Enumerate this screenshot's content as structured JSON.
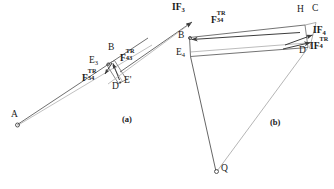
{
  "figure": {
    "background_color": "#ffffff",
    "line_color": "#4a4a4a",
    "line_color_light": "#9a9a9a",
    "text_color": "#1a1a1a",
    "width": 334,
    "height": 189
  },
  "panels": [
    {
      "id": "panel-a",
      "label": "(a)",
      "x": 124,
      "y": 119
    },
    {
      "id": "panel-b",
      "label": "(b)",
      "x": 272,
      "y": 122
    }
  ],
  "panel_a": {
    "points": [
      {
        "name": "A",
        "label": "A",
        "x": 17,
        "y": 125,
        "marker": "circle",
        "label_x": 11,
        "label_y": 112
      },
      {
        "name": "E3",
        "base": "E",
        "subscript": "3",
        "x": 105,
        "y": 65,
        "marker": "dot",
        "label_x": 91,
        "label_y": 59
      },
      {
        "name": "B",
        "label": "B",
        "x": 112,
        "y": 62,
        "marker": "none",
        "label_x": 110,
        "label_y": 48
      },
      {
        "name": "D",
        "label": "D",
        "x": 118,
        "y": 83,
        "marker": "dot",
        "label_x": 113,
        "label_y": 84
      },
      {
        "name": "Ep",
        "label": "E'",
        "x": 126,
        "y": 81,
        "marker": "none",
        "label_x": 124,
        "label_y": 77
      }
    ],
    "force_labels": [
      {
        "name": "F43",
        "base": "F",
        "sup": "TR",
        "sub": "43",
        "x": 120,
        "y": 56
      },
      {
        "name": "F34",
        "base": "F",
        "sup": "TR",
        "sub": "34",
        "x": 84,
        "y": 75
      }
    ]
  },
  "panel_b": {
    "points": [
      {
        "name": "B",
        "label": "B",
        "x": 188,
        "y": 38,
        "marker": "dot",
        "label_x": 180,
        "label_y": 32
      },
      {
        "name": "E4",
        "base": "E",
        "subscript": "4",
        "x": 190,
        "y": 56,
        "marker": "none",
        "label_x": 178,
        "label_y": 50
      },
      {
        "name": "H",
        "label": "H",
        "x": 304,
        "y": 25,
        "marker": "none",
        "label_x": 300,
        "label_y": 8
      },
      {
        "name": "C",
        "label": "C",
        "x": 315,
        "y": 22,
        "marker": "none",
        "label_x": 313,
        "label_y": 7
      },
      {
        "name": "D",
        "label": "D",
        "x": 307,
        "y": 48,
        "marker": "none",
        "label_x": 304,
        "label_y": 46
      },
      {
        "name": "Q",
        "label": "Q",
        "x": 216,
        "y": 172,
        "marker": "circle",
        "label_x": 222,
        "label_y": 164
      }
    ],
    "force_labels": [
      {
        "name": "IF3",
        "base": "IF",
        "sup": "",
        "sub": "3",
        "x": 176,
        "y": 6,
        "bold": true
      },
      {
        "name": "F34",
        "base": "F",
        "sup": "TR",
        "sub": "34",
        "x": 213,
        "y": 18,
        "bold": true
      },
      {
        "name": "IF4",
        "base": "IF",
        "sup": "",
        "sub": "4",
        "x": 315,
        "y": 30,
        "bold": true
      },
      {
        "name": "IF4TR",
        "base": "IF",
        "sup": "TR",
        "sub": "4",
        "x": 313,
        "y": 44,
        "bold": true
      }
    ]
  },
  "icons": {
    "arrowhead": "arrow-head-icon",
    "vertex_marker": "vertex-circle-icon"
  }
}
